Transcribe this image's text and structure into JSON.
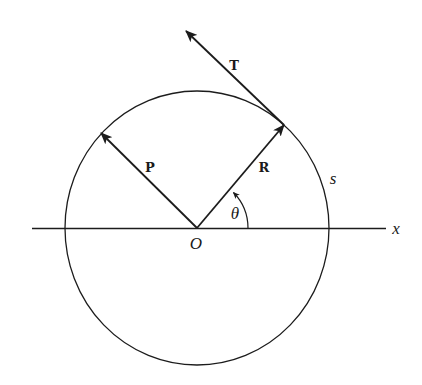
{
  "diagram": {
    "labels": {
      "tangent_vector": "T",
      "vector_p": "P",
      "vector_r": "R",
      "arc_length": "s",
      "angle": "θ",
      "origin": "O",
      "x_axis": "x"
    },
    "colors": {
      "ink": "#1c1c1c",
      "background": "#ffffff"
    }
  }
}
